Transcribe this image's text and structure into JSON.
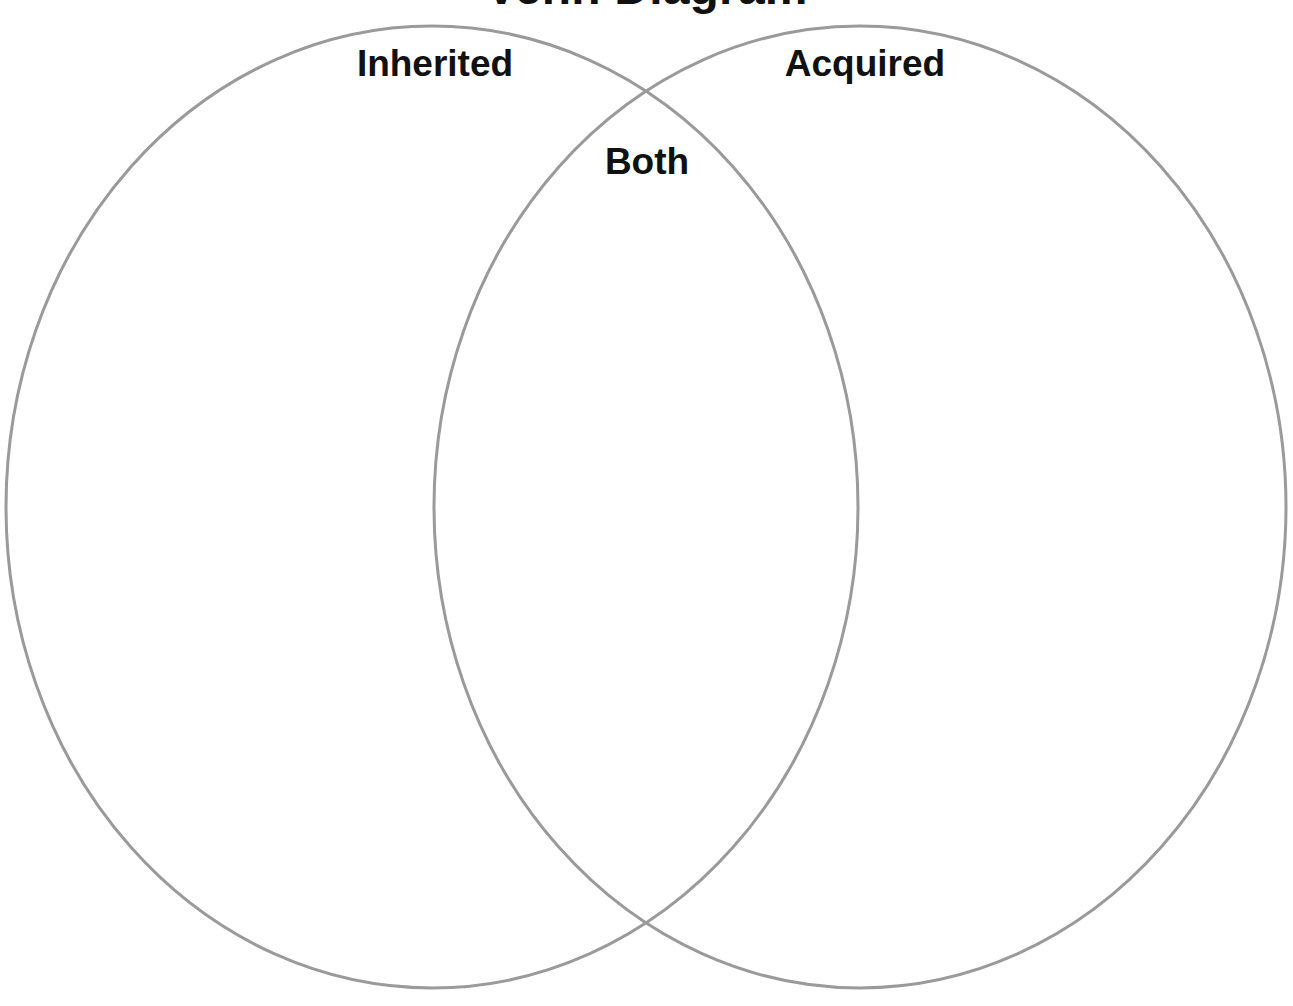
{
  "page": {
    "title": "Venn Diagram",
    "background_color": "#ffffff"
  },
  "diagram": {
    "type": "venn",
    "set_count": 2,
    "stroke_color": "#9a9a9a",
    "stroke_width": 3,
    "fill": "none",
    "regions": [
      {
        "id": "left-only",
        "label": "Inherited",
        "items": []
      },
      {
        "id": "overlap",
        "label": "Both",
        "items": []
      },
      {
        "id": "right-only",
        "label": "Acquired",
        "items": []
      }
    ],
    "labels": {
      "left": "Inherited",
      "right": "Acquired",
      "overlap": "Both"
    },
    "geometry": {
      "left_circle": {
        "cx": 432,
        "cy": 507,
        "rx": 426,
        "ry": 481
      },
      "right_circle": {
        "cx": 860,
        "cy": 507,
        "rx": 426,
        "ry": 481
      }
    }
  }
}
